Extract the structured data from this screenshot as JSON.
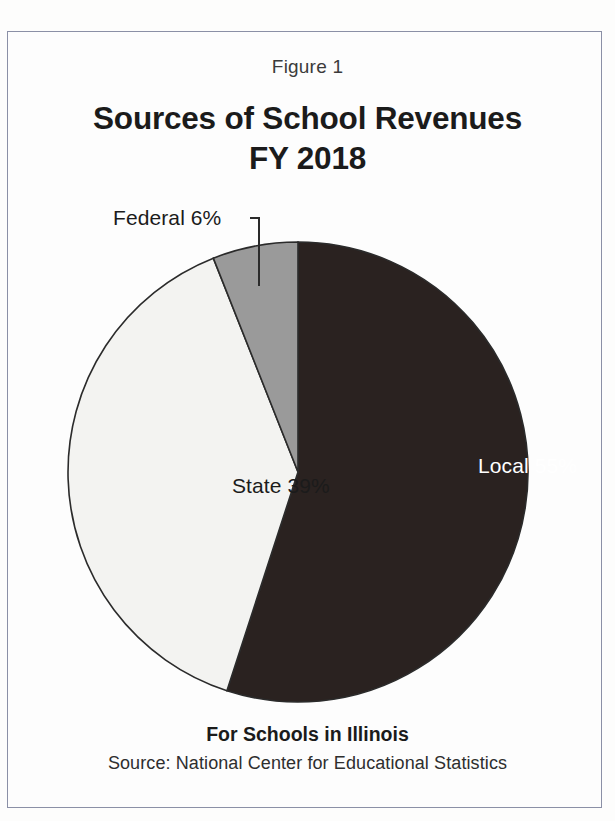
{
  "figure": {
    "number_label": "Figure 1",
    "title_line1": "Sources of School Revenues",
    "title_line2": "FY 2018",
    "footer_bold": "For Schools in Illinois",
    "footer_source": "Source: National Center for Educational Statistics"
  },
  "chart_data": {
    "type": "pie",
    "title": "Sources of School Revenues FY 2018",
    "subtitle": "For Schools in Illinois",
    "source": "Source: National Center for Educational Statistics",
    "categories": [
      "Local",
      "State",
      "Federal"
    ],
    "values": [
      55,
      39,
      6
    ],
    "unit": "percent",
    "labels": [
      "Local 55%",
      "State 39%",
      "Federal 6%"
    ],
    "slices": [
      {
        "name": "Local",
        "value": 55,
        "label": "Local 55%",
        "color": "#2a2220",
        "label_color": "#ffffff",
        "label_placement": "inside",
        "start_angle_deg": 0,
        "end_angle_deg": 198
      },
      {
        "name": "State",
        "value": 39,
        "label": "State 39%",
        "color": "#f3f3f1",
        "label_color": "#1b1b1b",
        "label_placement": "inside",
        "start_angle_deg": 198,
        "end_angle_deg": 338.4
      },
      {
        "name": "Federal",
        "value": 6,
        "label": "Federal 6%",
        "color": "#9a9a9a",
        "label_color": "#1b1b1b",
        "label_placement": "outside-leader",
        "start_angle_deg": 338.4,
        "end_angle_deg": 360
      }
    ],
    "start_angle_deg": 0,
    "direction": "clockwise",
    "legend": "none",
    "grid": false,
    "outline_color": "#2b2b2b",
    "center": {
      "x": 298,
      "y": 472
    },
    "radius": 230,
    "leader_line": {
      "from_x": 250,
      "from_y": 218,
      "elbow_x": 259,
      "elbow_y": 218,
      "to_x": 259,
      "to_y": 286
    }
  },
  "style": {
    "page_background": "#fdfdfc",
    "frame_color": "#8b90a6",
    "text_color": "#1b1b1b"
  }
}
